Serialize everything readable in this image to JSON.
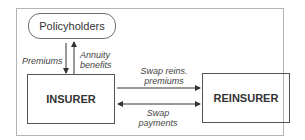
{
  "nodes": {
    "policyholders": "Policyholders",
    "insurer": "INSURER",
    "reinsurer": "REINSURER"
  },
  "edges": {
    "premiums": "Premiums",
    "annuity_line1": "Annuity",
    "annuity_line2": "benefits",
    "swap_reins_line1": "Swap reins.",
    "swap_reins_line2": "premiums",
    "swap_pay_line1": "Swap",
    "swap_pay_line2": "payments"
  },
  "colors": {
    "line": "#333333",
    "frame": "#b4b4b4"
  }
}
